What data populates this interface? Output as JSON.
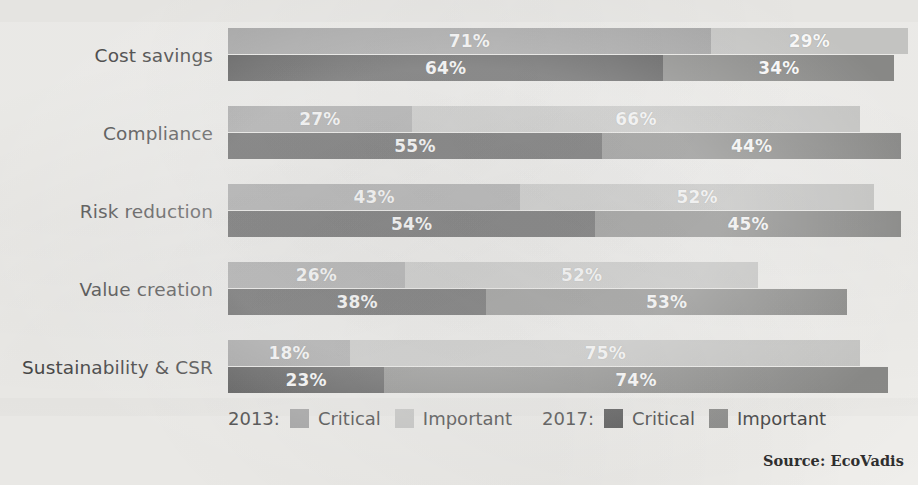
{
  "chart_data": {
    "type": "bar",
    "subtype": "grouped-stacked-horizontal",
    "title": "",
    "xlabel": "",
    "ylabel": "",
    "xlim": [
      0,
      100
    ],
    "grid": false,
    "legend_position": "bottom",
    "categories": [
      "Cost savings",
      "Compliance",
      "Risk reduction",
      "Value creation",
      "Sustainability & CSR"
    ],
    "groups": [
      "2013",
      "2017"
    ],
    "series": [
      {
        "name": "2013: Critical",
        "group": "2013",
        "stack": "critical",
        "color": "#a6a6a6",
        "values": [
          71,
          27,
          43,
          26,
          18
        ]
      },
      {
        "name": "2013: Important",
        "group": "2013",
        "stack": "important",
        "color": "#c9c9c7",
        "values": [
          29,
          66,
          52,
          52,
          75
        ]
      },
      {
        "name": "2017: Critical",
        "group": "2017",
        "stack": "critical",
        "color": "#575757",
        "values": [
          64,
          55,
          54,
          38,
          23
        ]
      },
      {
        "name": "2017: Important",
        "group": "2017",
        "stack": "important",
        "color": "#8c8c8a",
        "values": [
          34,
          44,
          45,
          53,
          74
        ]
      }
    ],
    "rows": [
      {
        "category": "Cost savings",
        "bar_2013": {
          "critical": 71,
          "important": 29,
          "critical_label": "71%",
          "important_label": "29%"
        },
        "bar_2017": {
          "critical": 64,
          "important": 34,
          "critical_label": "64%",
          "important_label": "34%"
        }
      },
      {
        "category": "Compliance",
        "bar_2013": {
          "critical": 27,
          "important": 66,
          "critical_label": "27%",
          "important_label": "66%"
        },
        "bar_2017": {
          "critical": 55,
          "important": 44,
          "critical_label": "55%",
          "important_label": "44%"
        }
      },
      {
        "category": "Risk reduction",
        "bar_2013": {
          "critical": 43,
          "important": 52,
          "critical_label": "43%",
          "important_label": "52%"
        },
        "bar_2017": {
          "critical": 54,
          "important": 45,
          "critical_label": "54%",
          "important_label": "45%"
        }
      },
      {
        "category": "Value creation",
        "bar_2013": {
          "critical": 26,
          "important": 52,
          "critical_label": "26%",
          "important_label": "52%"
        },
        "bar_2017": {
          "critical": 38,
          "important": 53,
          "critical_label": "38%",
          "important_label": "53%"
        }
      },
      {
        "category": "Sustainability & CSR",
        "bar_2013": {
          "critical": 18,
          "important": 75,
          "critical_label": "18%",
          "important_label": "75%"
        },
        "bar_2017": {
          "critical": 23,
          "important": 74,
          "critical_label": "23%",
          "important_label": "74%"
        }
      }
    ]
  },
  "legend": {
    "year_2013": "2013:",
    "year_2017": "2017:",
    "critical_label_2013": "Critical",
    "important_label_2013": "Important",
    "critical_label_2017": "Critical",
    "important_label_2017": "Important"
  },
  "source": {
    "text": "Source: EcoVadis"
  },
  "colors": {
    "critical_2013": "#a6a6a6",
    "important_2013": "#c9c9c7",
    "critical_2017": "#575757",
    "important_2017": "#8c8c8a",
    "label_text": "#4a4a4a",
    "value_text": "#ffffff",
    "background": "#f2f1ee"
  }
}
